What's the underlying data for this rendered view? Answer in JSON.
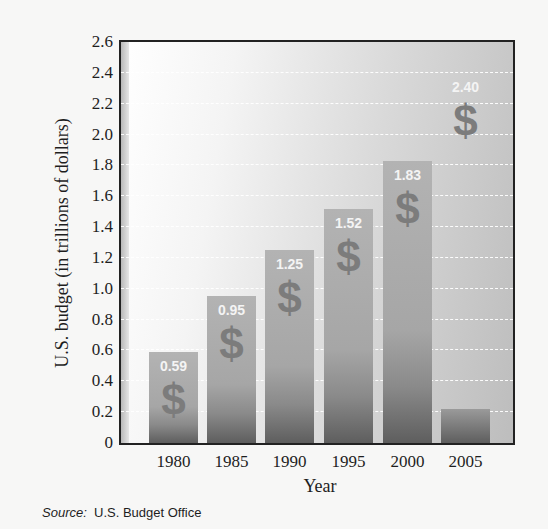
{
  "chart_data": {
    "type": "bar",
    "title": "",
    "xlabel": "Year",
    "ylabel": "U.S. budget (in trillions of dollars)",
    "categories": [
      "1980",
      "1985",
      "1990",
      "1995",
      "2000",
      "2005"
    ],
    "values": [
      0.59,
      0.95,
      1.25,
      1.52,
      1.83,
      2.4
    ],
    "data_labels": [
      "0.59",
      "0.95",
      "1.25",
      "1.52",
      "1.83",
      "2.40"
    ],
    "ylim": [
      0,
      2.6
    ],
    "yticks": [
      "0",
      "0.2",
      "0.4",
      "0.6",
      "0.8",
      "1.0",
      "1.2",
      "1.4",
      "1.6",
      "1.8",
      "2.0",
      "2.2",
      "2.4",
      "2.6"
    ],
    "grid": true,
    "legend": null,
    "bar_icon": "dollar-sign",
    "source_label": "Source:",
    "source_text": "U.S. Budget Office"
  }
}
